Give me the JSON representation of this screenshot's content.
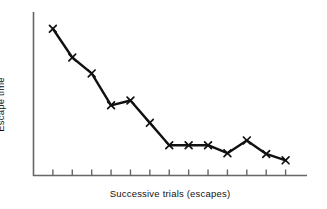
{
  "chart_data": {
    "type": "line",
    "title": "",
    "subtitle": "",
    "xlabel": "Successive trials (escapes)",
    "ylabel": "Escape time",
    "legend": [],
    "legend_position": "none",
    "grid": false,
    "axis_style": "x-axis and y-axis lines only, no numeric tick labels",
    "marker": "x",
    "x_tick_count": 13,
    "x_tick_labels": [],
    "y_tick_labels": [],
    "xlim": [
      0,
      14
    ],
    "ylim": [
      0,
      10
    ],
    "x": [
      1,
      2,
      3,
      4,
      5,
      6,
      7,
      8,
      9,
      10,
      11,
      12,
      13
    ],
    "categories": [
      "1",
      "2",
      "3",
      "4",
      "5",
      "6",
      "7",
      "8",
      "9",
      "10",
      "11",
      "12",
      "13"
    ],
    "series": [
      {
        "name": "Escape time",
        "values": [
          9.2,
          7.4,
          6.4,
          4.4,
          4.7,
          3.3,
          1.9,
          1.9,
          1.9,
          1.4,
          2.2,
          1.35,
          0.95
        ]
      }
    ],
    "annotations": []
  },
  "labels": {
    "y_axis_title": "Escape time",
    "x_axis_title": "Successive trials (escapes)"
  },
  "colors": {
    "line": "#111111",
    "marker": "#111111",
    "axis": "#555555",
    "background": "#ffffff"
  }
}
